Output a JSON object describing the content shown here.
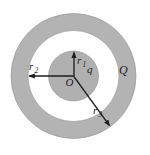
{
  "diagram": {
    "background": "#ffffff",
    "shell_fill": "#b3b3b3",
    "gap_fill": "#ffffff",
    "inner_fill": "#b0b0b0",
    "edge_color": "#8f8f8f",
    "line_color": "#1c1c1c",
    "labels": {
      "origin": "O",
      "inner_charge": "q",
      "outer_charge": "Q",
      "r1": {
        "base": "r",
        "sub": "1"
      },
      "r2": {
        "base": "r",
        "sub": "2"
      },
      "r3": {
        "base": "r",
        "sub": "3"
      }
    }
  }
}
